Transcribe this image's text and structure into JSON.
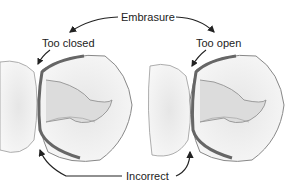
{
  "diagram": {
    "labels": {
      "top": "Embrasure",
      "left": "Too closed",
      "right": "Too open",
      "bottom": "Incorrect"
    },
    "colors": {
      "outline": "#555555",
      "margin_band": "#6a6a6a",
      "tooth_fill": "#f4f4f4",
      "shadow": "#d8d8d8"
    }
  }
}
